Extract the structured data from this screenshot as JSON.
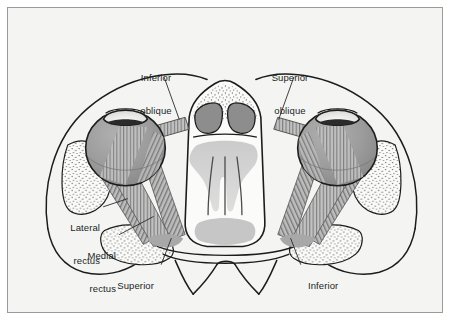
{
  "figure": {
    "kind": "anatomical-diagram",
    "background_color": "#f4f4f2",
    "frame_color": "#9a9a9a",
    "page_color": "#ffffff",
    "ink_color": "#201f1f"
  },
  "palette": {
    "outline": "#1c1c1c",
    "globe_fill": "#9b9b9b",
    "globe_shade": "#8a8a8a",
    "cornea_fill": "#f0f0ee",
    "iris_band": "#2b2b2b",
    "muscle_fill": "#b8b8b8",
    "muscle_stripe": "#6f6f6f",
    "sinus_dark": "#8d8d8d",
    "soft_tissue": "#c9c9c9",
    "bone_fill": "#fbfbf9",
    "stipple": "#3a3a3a"
  },
  "labels": [
    {
      "id": "inferior-oblique-left",
      "line1": "Inferior",
      "line2": "oblique",
      "align": "center",
      "x": 128,
      "y": 44,
      "width": 58
    },
    {
      "id": "superior-oblique-right",
      "line1": "Superior",
      "line2": "oblique",
      "align": "center",
      "x": 258,
      "y": 44,
      "width": 60
    },
    {
      "id": "lateral-rectus-left",
      "line1": "Lateral",
      "line2": "rectus",
      "align": "right",
      "x": 46,
      "y": 198,
      "width": 48
    },
    {
      "id": "medial-rectus-left",
      "line1": "Medial",
      "line2": "rectus",
      "align": "right",
      "x": 58,
      "y": 226,
      "width": 50
    },
    {
      "id": "superior-rectus-left",
      "line1": "Superior",
      "line2": "rectus",
      "align": "right",
      "x": 96,
      "y": 262,
      "width": 56
    },
    {
      "id": "inferior-rectus-right",
      "line1": "Inferior",
      "line2": "rectus",
      "align": "left",
      "x": 296,
      "y": 262,
      "width": 56
    }
  ],
  "leader_lines": [
    {
      "id": "leader-inferior-oblique",
      "from": [
        157,
        70
      ],
      "to": [
        172,
        112
      ]
    },
    {
      "id": "leader-superior-oblique",
      "from": [
        287,
        70
      ],
      "to": [
        277,
        112
      ]
    },
    {
      "id": "leader-lateral-rectus",
      "from": [
        96,
        202
      ],
      "to": [
        118,
        196
      ]
    },
    {
      "id": "leader-medial-rectus",
      "from": [
        110,
        230
      ],
      "to": [
        143,
        213
      ]
    },
    {
      "id": "leader-superior-rectus",
      "from": [
        154,
        262
      ],
      "to": [
        163,
        236
      ]
    },
    {
      "id": "leader-inferior-rectus",
      "from": [
        294,
        262
      ],
      "to": [
        285,
        236
      ]
    }
  ],
  "structures": {
    "globes": [
      {
        "id": "globe-left",
        "cx": 118,
        "cy": 141,
        "rx": 40,
        "ry": 38
      },
      {
        "id": "globe-right",
        "cx": 331,
        "cy": 141,
        "rx": 40,
        "ry": 38
      }
    ],
    "corneas": [
      {
        "id": "cornea-left",
        "cx": 118,
        "cy": 110
      },
      {
        "id": "cornea-right",
        "cx": 331,
        "cy": 110
      }
    ],
    "muscle_groups": [
      "lateral-rectus-left",
      "medial-rectus-left",
      "superior-rectus-left",
      "inferior-oblique-left",
      "lateral-rectus-right",
      "medial-rectus-right",
      "inferior-rectus-right",
      "superior-oblique-right"
    ],
    "central_bone": "ethmoid-sphenoid-complex",
    "sinus_cells": [
      "ethmoid-cell-left",
      "ethmoid-cell-right"
    ],
    "zygomatic_arches": [
      "arch-left",
      "arch-right"
    ]
  }
}
